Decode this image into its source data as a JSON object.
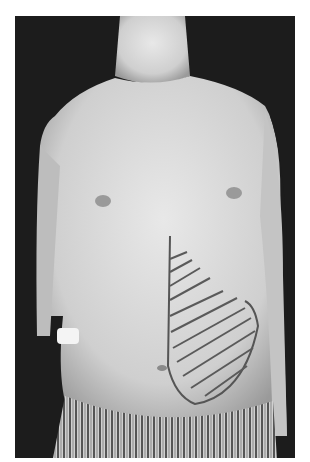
{
  "image": {
    "subject": "Frontal photograph of a thin male torso with a hatched region marked on the right side of the abdomen",
    "colors": {
      "background": "#1c1c1c",
      "skin": "#d9d9d9",
      "marking": "#555555",
      "frame": "#ffffff"
    }
  }
}
